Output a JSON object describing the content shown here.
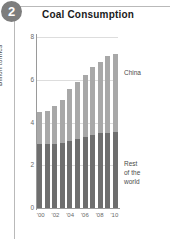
{
  "badge": {
    "number": "2"
  },
  "chart_data": {
    "type": "bar",
    "subtype": "stacked-bar",
    "title": "Coal Consumption",
    "xlabel": "",
    "ylabel": "Billion tonnes",
    "ylim": [
      0,
      8
    ],
    "yticks": [
      "0",
      "2",
      "4",
      "6",
      "8"
    ],
    "ytick_values": [
      0,
      2,
      4,
      6,
      8
    ],
    "grid": true,
    "grid_axis": "y",
    "legend_position": "inline-right",
    "categories": [
      "2000",
      "2001",
      "2002",
      "2003",
      "2004",
      "2005",
      "2006",
      "2007",
      "2008",
      "2009",
      "2010"
    ],
    "xtick_labels": [
      "'00",
      "'02",
      "'04",
      "'06",
      "'08",
      "'10"
    ],
    "xtick_categories": [
      "2000",
      "2002",
      "2004",
      "2006",
      "2008",
      "2010"
    ],
    "series": [
      {
        "name": "Rest of the world",
        "label": "Rest\nof the\nworld",
        "color": "#6e6e6e",
        "values": [
          3.0,
          3.0,
          3.0,
          3.05,
          3.15,
          3.25,
          3.3,
          3.4,
          3.5,
          3.5,
          3.55
        ]
      },
      {
        "name": "China",
        "label": "China",
        "color": "#a8a8a8",
        "values": [
          1.5,
          1.55,
          1.75,
          2.0,
          2.4,
          2.65,
          2.9,
          3.2,
          3.35,
          3.6,
          3.65
        ]
      }
    ],
    "totals": [
      4.5,
      4.55,
      4.75,
      5.05,
      5.55,
      5.9,
      6.2,
      6.6,
      6.85,
      7.1,
      7.2
    ]
  },
  "colors": {
    "china": "#a8a8a8",
    "rest_of_world": "#6e6e6e",
    "grid": "#dddddd",
    "axis": "#9a9a9a",
    "badge": "#7d7d7d"
  }
}
